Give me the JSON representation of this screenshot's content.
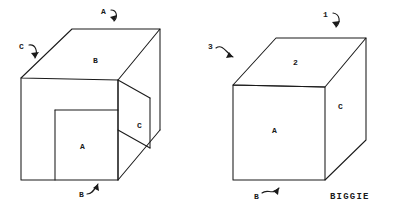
{
  "figures": [
    {
      "id": "left-figure",
      "description": "open box with notch",
      "face_labels": [
        {
          "name": "top-face-label",
          "text": "B",
          "x": 93,
          "y": 57
        },
        {
          "name": "inner-face-label",
          "text": "A",
          "x": 80,
          "y": 143
        },
        {
          "name": "side-face-label",
          "text": "C",
          "x": 137,
          "y": 122
        }
      ],
      "callouts": [
        {
          "name": "callout-a",
          "text": "A",
          "x": 101,
          "y": 8
        },
        {
          "name": "callout-c",
          "text": "C",
          "x": 19,
          "y": 43
        },
        {
          "name": "callout-b",
          "text": "B",
          "x": 79,
          "y": 191
        }
      ]
    },
    {
      "id": "right-figure",
      "description": "closed solid box",
      "face_labels": [
        {
          "name": "top-face-label",
          "text": "2",
          "x": 293,
          "y": 59
        },
        {
          "name": "front-face-label",
          "text": "A",
          "x": 272,
          "y": 127
        },
        {
          "name": "side-face-label",
          "text": "C",
          "x": 338,
          "y": 103
        }
      ],
      "callouts": [
        {
          "name": "callout-1",
          "text": "1",
          "x": 323,
          "y": 11
        },
        {
          "name": "callout-3",
          "text": "3",
          "x": 208,
          "y": 43
        },
        {
          "name": "callout-b",
          "text": "B",
          "x": 254,
          "y": 193
        }
      ]
    }
  ],
  "caption": {
    "name": "biggie-caption",
    "text": "BIGGIE",
    "x": 330,
    "y": 193
  },
  "colors": {
    "ink": "#1a1a1a",
    "paper": "#ffffff"
  }
}
